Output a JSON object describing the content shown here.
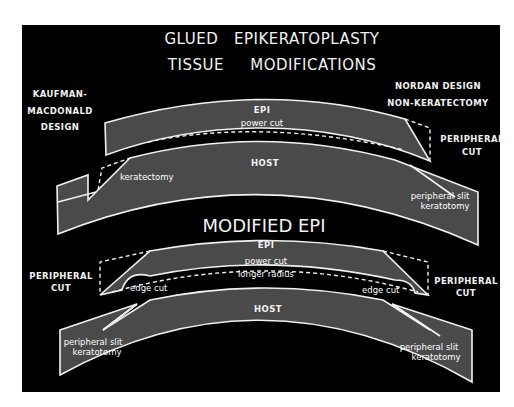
{
  "figure": {
    "title_line1": "GLUED   EPIKERATOPLASTY",
    "title_line2": "TISSUE     MODIFICATIONS",
    "colors": {
      "background": "#000000",
      "tissue_fill": "#4a4a4a",
      "line": "#f0f0f0",
      "page": "#ffffff"
    },
    "top_diagram": {
      "left_design_label": [
        "KAUFMAN-",
        "MACDONALD",
        "DESIGN"
      ],
      "right_design_label": [
        "NORDAN DESIGN",
        "NON-KERATECTOMY"
      ],
      "right_cut_label": [
        "PERIPHERAL",
        "CUT"
      ],
      "epi_label": "EPI",
      "power_cut_label": "power cut",
      "host_label": "HOST",
      "keratectomy_label": "keratectomy",
      "slit_label": [
        "peripheral slit",
        "keratotomy"
      ]
    },
    "bottom_diagram": {
      "heading": "MODIFIED EPI",
      "epi_label": "EPI",
      "power_cut_label": "power cut",
      "longer_radius_label": "longer radius",
      "left_cut_label": [
        "PERIPHERAL",
        "CUT"
      ],
      "right_cut_label": [
        "PERIPHERAL",
        "CUT"
      ],
      "edge_cut_left": "edge cut",
      "edge_cut_right": "edge cut",
      "host_label": "HOST",
      "slit_left": [
        "peripheral slit",
        "keratotomy"
      ],
      "slit_right": [
        "peripheral slit",
        "keratotomy"
      ]
    }
  }
}
